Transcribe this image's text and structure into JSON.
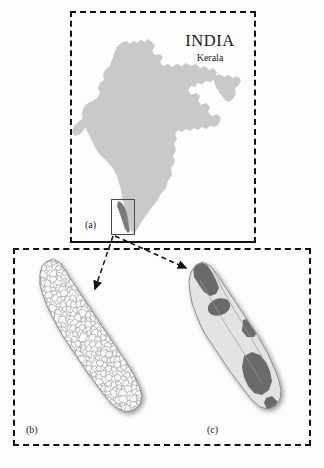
{
  "figure": {
    "background_color": "#fdfdfc",
    "frame_color": "#111111"
  },
  "panel_a": {
    "label": "(a)",
    "title": "INDIA",
    "subtitle": "Kerala",
    "map_fill": "#c9c9c9",
    "highlight_fill": "#7a7a7a",
    "inset_box_color": "#4a4a4a",
    "description": "Outline map of India filled light gray with the state of Kerala highlighted dark gray along the southwest coast, enclosed by a thin solid rectangle."
  },
  "panel_b": {
    "label": "(b)",
    "map_fill": "#fbfbfb",
    "boundary_color": "#8a8a8a",
    "shadow_color": "#bdbdbd",
    "description": "Map of Kerala subdivided into many small administrative units rendered as white polygons with thin gray outlines."
  },
  "panel_c": {
    "label": "(c)",
    "map_fill": "#e2e2e0",
    "highlight_fill": "#6b6b6b",
    "boundary_color": "#9a9a9a",
    "shadow_color": "#bdbdbd",
    "description": "Map of Kerala shaded light gray with several dark gray regions marking highlighted zones at the northern tip, mid-north interior and along the eastern and southern margins."
  },
  "connectors": {
    "arrow_color": "#111111",
    "style": "dashed",
    "items": [
      {
        "name": "arrow-to-panel-b",
        "from": "kerala-inset-box",
        "to": "panel-b-map"
      },
      {
        "name": "arrow-to-panel-c",
        "from": "kerala-inset-box",
        "to": "panel-c-map"
      }
    ]
  }
}
